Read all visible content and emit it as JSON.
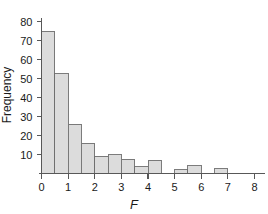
{
  "chart_data": {
    "type": "bar",
    "subtype": "histogram",
    "title": "",
    "subtitle": "",
    "xlabel": "F",
    "ylabel": "Frequency",
    "xlim": [
      0,
      8
    ],
    "ylim": [
      0,
      84
    ],
    "bin_width": 0.5,
    "grid": false,
    "legend": null,
    "bar_fill_color": "#dcdcdc",
    "bar_edge_color": "#6e6e6e",
    "axis_color": "#585858",
    "xticks": [
      0,
      1,
      2,
      3,
      4,
      5,
      6,
      7,
      8
    ],
    "xtick_labels": [
      "0",
      "1",
      "2",
      "3",
      "4",
      "5",
      "6",
      "7",
      "8"
    ],
    "yticks": [
      10,
      20,
      30,
      40,
      50,
      60,
      70,
      80
    ],
    "ytick_labels": [
      "10",
      "20",
      "30",
      "40",
      "50",
      "60",
      "70",
      "80"
    ],
    "bin_edges": [
      0,
      0.5,
      1,
      1.5,
      2,
      2.5,
      3,
      3.5,
      4,
      4.5,
      5,
      5.5,
      6,
      6.5,
      7,
      7.5,
      8
    ],
    "bin_centers": [
      0.25,
      0.75,
      1.25,
      1.75,
      2.25,
      2.75,
      3.25,
      3.75,
      4.25,
      4.75,
      5.25,
      5.75,
      6.25,
      6.75,
      7.25,
      7.75
    ],
    "values": [
      75,
      52.5,
      26,
      16,
      9,
      10,
      7.5,
      3.5,
      7,
      0,
      2,
      4,
      0,
      2.5,
      0,
      0
    ]
  }
}
